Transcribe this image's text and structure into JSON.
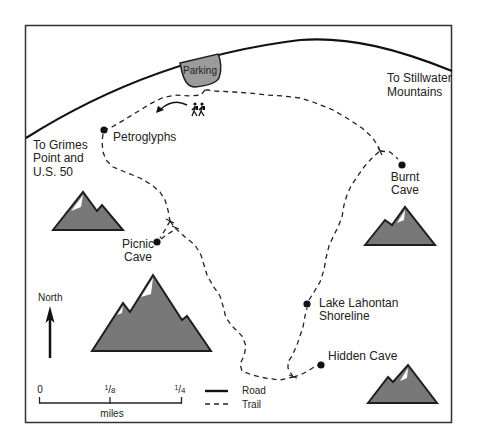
{
  "labels": {
    "parking": "Parking",
    "to_stillwater": [
      "To Stillwater",
      "Mountains"
    ],
    "to_grimes": [
      "To Grimes",
      "Point and",
      "U.S. 50"
    ],
    "petroglyphs": "Petroglyphs",
    "picnic_cave": [
      "Picnic",
      "Cave"
    ],
    "burnt_cave": [
      "Burnt",
      "Cave"
    ],
    "lake_lahontan": [
      "Lake Lahontan",
      "Shoreline"
    ],
    "hidden_cave": "Hidden Cave"
  },
  "compass": {
    "label": "North",
    "icon": "north-arrow-icon"
  },
  "scale": {
    "zero": "0",
    "eighth": {
      "num": "1",
      "sep": "/",
      "den": "8"
    },
    "quarter": {
      "num": "1",
      "sep": "/",
      "den": "4"
    },
    "unit": "miles"
  },
  "legend": {
    "items": [
      {
        "label": "Road",
        "style": "solid"
      },
      {
        "label": "Trail",
        "style": "dashed"
      }
    ]
  },
  "icons": {
    "hikers": "hikers-icon",
    "direction_arrow": "curved-arrow-icon",
    "mountain": "mountain-icon",
    "point_of_interest": "dot-marker-icon"
  },
  "colors": {
    "background": "#ffffff",
    "ink": "#222222",
    "mountain_fill": "#787878",
    "parking_fill": "#9b9b9b",
    "snow": "#ffffff"
  }
}
